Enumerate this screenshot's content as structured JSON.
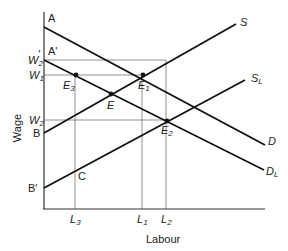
{
  "diagram": {
    "type": "supply-demand",
    "axes": {
      "y_label": "Wage",
      "x_label": "Labour"
    },
    "wage_levels": [
      {
        "id": "W2prime",
        "label": "W",
        "sub": "2",
        "prime": "'",
        "y": 60
      },
      {
        "id": "W1",
        "label": "W",
        "sub": "1",
        "prime": "",
        "y": 75
      },
      {
        "id": "W2",
        "label": "W",
        "sub": "2",
        "prime": "",
        "y": 120
      }
    ],
    "labour_levels": [
      {
        "id": "L3",
        "label": "L",
        "sub": "3",
        "x": 75
      },
      {
        "id": "L1",
        "label": "L",
        "sub": "1",
        "x": 142
      },
      {
        "id": "L2",
        "label": "L",
        "sub": "2",
        "x": 166
      }
    ],
    "intercepts": {
      "A": "A",
      "A_prime": "A'",
      "B": "B",
      "B_prime": "B'"
    },
    "curves": {
      "S": {
        "label": "S",
        "sub": ""
      },
      "S_L": {
        "label": "S",
        "sub": "L"
      },
      "D": {
        "label": "D",
        "sub": ""
      },
      "D_L": {
        "label": "D",
        "sub": "L"
      }
    },
    "points": {
      "E": {
        "label": "E",
        "sub": ""
      },
      "E1": {
        "label": "E",
        "sub": "1"
      },
      "E2": {
        "label": "E",
        "sub": "2"
      },
      "E3": {
        "label": "E",
        "sub": "3"
      },
      "C": {
        "label": "C",
        "sub": ""
      }
    }
  }
}
